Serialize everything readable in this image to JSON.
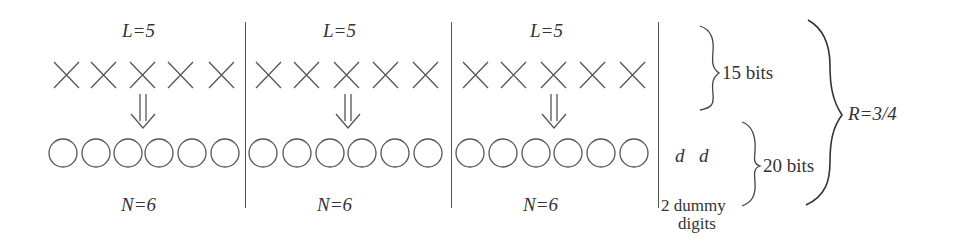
{
  "diagram": {
    "title": "",
    "blocks": [
      {
        "top_label": "L=5",
        "bottom_label": "N=6",
        "input_symbols": 5,
        "output_symbols": 6
      },
      {
        "top_label": "L=5",
        "bottom_label": "N=6",
        "input_symbols": 5,
        "output_symbols": 6
      },
      {
        "top_label": "L=5",
        "bottom_label": "N=6",
        "input_symbols": 5,
        "output_symbols": 6
      }
    ],
    "input_symbol_icon": "cross-icon",
    "output_symbol_icon": "circle-icon",
    "arrow_icon": "double-down-arrow-icon",
    "dummy": {
      "symbols": [
        "d",
        "d"
      ],
      "caption_line1": "2 dummy",
      "caption_line2": "digits"
    },
    "braces": {
      "input_bits": "15 bits",
      "output_bits": "20 bits",
      "rate": "R=3/4"
    },
    "colors": {
      "stroke": "#555555",
      "text": "#333333",
      "background": "#ffffff"
    }
  }
}
